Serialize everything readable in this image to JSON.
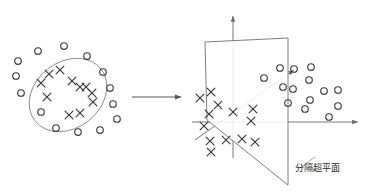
{
  "figure": {
    "title": "",
    "background_color": "#ffffff",
    "stroke_color": "#3a3a3a",
    "ellipse_color": "#8a8a8a",
    "plane_color": "#6f6f6f",
    "axis_color": "#6a6a6a",
    "label_color": "#2b2b2b"
  },
  "left_panel": {
    "name": "input-space",
    "boundary": {
      "shape": "ellipse",
      "cx": 68,
      "cy": 95,
      "rx": 42,
      "ry": 33,
      "rotation": -38
    },
    "inner_class": {
      "label": "X",
      "marker": "x-mark",
      "points": [
        [
          49,
          74
        ],
        [
          60,
          70
        ],
        [
          41,
          83
        ],
        [
          72,
          81
        ],
        [
          80,
          87
        ],
        [
          86,
          87
        ],
        [
          92,
          93
        ],
        [
          93,
          102
        ],
        [
          47,
          97
        ],
        [
          69,
          115
        ],
        [
          80,
          113
        ]
      ]
    },
    "outer_class": {
      "label": "O",
      "marker": "circle",
      "points": [
        [
          38,
          51
        ],
        [
          64,
          46
        ],
        [
          87,
          56
        ],
        [
          18,
          61
        ],
        [
          103,
          72
        ],
        [
          16,
          76
        ],
        [
          110,
          88
        ],
        [
          21,
          93
        ],
        [
          113,
          104
        ],
        [
          41,
          112
        ],
        [
          117,
          119
        ],
        [
          56,
          128
        ],
        [
          78,
          132
        ],
        [
          100,
          130
        ]
      ]
    }
  },
  "transform_arrow": {
    "name": "mapping-arrow",
    "x1": 132,
    "y1": 97,
    "x2": 181,
    "y2": 97
  },
  "right_panel": {
    "name": "feature-space",
    "axes": {
      "origin": [
        233,
        122
      ],
      "vertical": {
        "x1": 233,
        "y1": 158,
        "x2": 233,
        "y2": 16
      },
      "horizontal": {
        "x1": 192,
        "y1": 122,
        "x2": 358,
        "y2": 122
      },
      "depth": {
        "x1": 195,
        "y1": 140,
        "x2": 294,
        "y2": 70
      }
    },
    "hyperplane": {
      "points": [
        [
          205,
          42
        ],
        [
          288,
          38
        ],
        [
          288,
          185
        ],
        [
          207,
          120
        ]
      ]
    },
    "class_x": {
      "label": "X",
      "marker": "x-mark",
      "points": [
        [
          200,
          98
        ],
        [
          211,
          92
        ],
        [
          218,
          105
        ],
        [
          209,
          114
        ],
        [
          233,
          112
        ],
        [
          253,
          109
        ],
        [
          204,
          126
        ],
        [
          251,
          121
        ],
        [
          210,
          141
        ],
        [
          226,
          140
        ],
        [
          242,
          139
        ],
        [
          255,
          142
        ],
        [
          211,
          152
        ]
      ]
    },
    "class_o": {
      "label": "O",
      "marker": "circle",
      "points": [
        [
          280,
          68
        ],
        [
          294,
          69
        ],
        [
          311,
          67
        ],
        [
          264,
          78
        ],
        [
          309,
          80
        ],
        [
          283,
          87
        ],
        [
          293,
          89
        ],
        [
          324,
          91
        ],
        [
          338,
          90
        ],
        [
          288,
          103
        ],
        [
          310,
          100
        ],
        [
          305,
          109
        ],
        [
          338,
          106
        ],
        [
          329,
          117
        ]
      ]
    },
    "hyperplane_label": {
      "text": "分隔超平面",
      "x": 317,
      "y": 171
    },
    "hyperplane_leader": {
      "x1": 300,
      "y1": 168,
      "x2": 315,
      "y2": 157
    }
  }
}
